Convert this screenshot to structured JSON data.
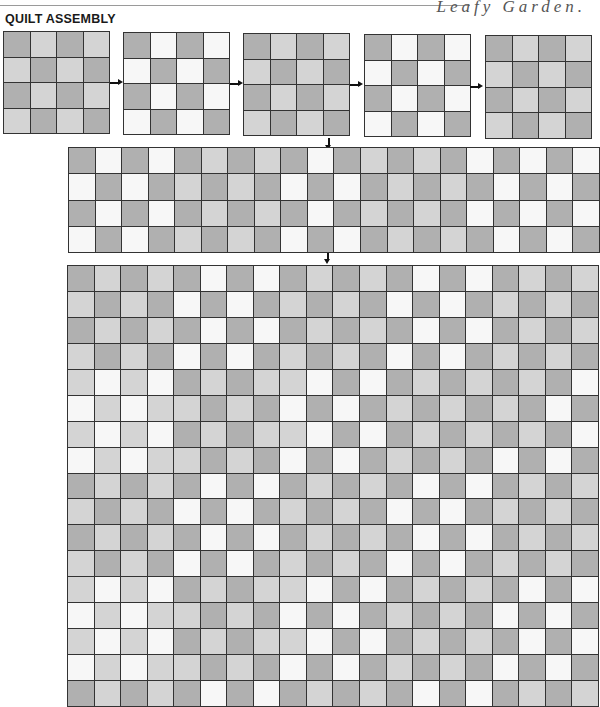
{
  "header": {
    "title": "QUILT ASSEMBLY",
    "brand": "Leafy Garden."
  },
  "colors": {
    "dark": "#b0b0b0",
    "light": "#d4d4d4",
    "white": "#f7f7f7",
    "line": "#333333"
  },
  "legend_codes": {
    "D": "dark gray square",
    "L": "light gray square",
    "W": "white square"
  },
  "blocks": [
    {
      "label": "block-1",
      "x": 3,
      "y": 31,
      "w": 105,
      "h": 101,
      "rows": [
        "DLDL",
        "LDLD",
        "DLDL",
        "LDLD"
      ]
    },
    {
      "label": "block-2",
      "x": 123,
      "y": 32,
      "w": 105,
      "h": 101,
      "rows": [
        "DWDW",
        "WDWD",
        "DWDW",
        "WDWD"
      ]
    },
    {
      "label": "block-3",
      "x": 243,
      "y": 33,
      "w": 105,
      "h": 101,
      "rows": [
        "DLDL",
        "LDLD",
        "DLDL",
        "LDLD"
      ]
    },
    {
      "label": "block-4",
      "x": 364,
      "y": 34,
      "w": 105,
      "h": 101,
      "rows": [
        "DWDW",
        "WDWD",
        "DWDW",
        "WDWD"
      ]
    },
    {
      "label": "block-5",
      "x": 485,
      "y": 35,
      "w": 105,
      "h": 102,
      "rows": [
        "DLDL",
        "LDLD",
        "DLDL",
        "LDLD"
      ]
    }
  ],
  "arrows_right": [
    {
      "x": 110,
      "y": 82
    },
    {
      "x": 230,
      "y": 83
    },
    {
      "x": 350,
      "y": 84
    },
    {
      "x": 470,
      "y": 86
    }
  ],
  "arrows_down": [
    {
      "x": 328,
      "y": 138
    },
    {
      "x": 327,
      "y": 252
    }
  ],
  "strip": {
    "x": 68,
    "y": 147,
    "w": 530,
    "h": 104,
    "rows": [
      "DWDWDLDLDWDLDLDWDWDW",
      "WDWDLDLDWDWDLDLDWDWD",
      "DWDWDLDLDWDLDLDWDWDW",
      "WDWDLDLDWDWDLDLDWDWD"
    ]
  },
  "quilt": {
    "x": 67,
    "y": 265,
    "w": 530,
    "h": 440,
    "rows": [
      "DLDLDWDWDLDLDWDWDLDL",
      "LDLDWDWDLDLDWDWDLDLD",
      "DLDLDWDWDLDLDWDWDLDL",
      "LDLDWDWDLDLDWDWDLDLD",
      "LWLWDLDLLWDWDLDLDLDW",
      "WLWLLDLDWDWDLDLDLDWD",
      "LWLWDLDLLWDWDLDLDLDW",
      "WLWLLDLDWDWDLDLDWDWD",
      "DLDLDWDWDLDLDWDWDLDL",
      "LDLDWDWDLDLDWDWDLDLD",
      "DLDLDWDWDLDLDWDWDLDL",
      "LDLDWDWDLDLDWDWDLDLD",
      "LWLWDLDLLWDWDLDLDWDW",
      "WLWLLDLDWDWDLDLDWDWD",
      "LWLWDLDLLWDWDLDLDWDW",
      "WLWLLDLDWDWDLDLDWDWD",
      "DLDLDWDWDLDLDWDWDLDL"
    ]
  }
}
